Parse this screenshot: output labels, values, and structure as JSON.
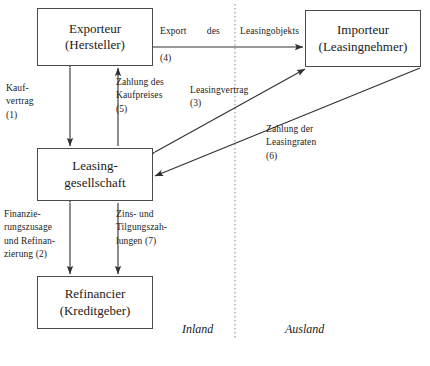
{
  "diagram": {
    "title_nodes": {
      "exporteur": {
        "line1": "Exporteur",
        "line2": "(Hersteller)"
      },
      "importeur": {
        "line1": "Importeur",
        "line2": "(Leasingnehmer)"
      },
      "leasinggesell": {
        "line1": "Leasing-",
        "line2": "gesellschaft"
      },
      "refinancier": {
        "line1": "Refinancier",
        "line2": "(Kreditgeber)"
      }
    },
    "edge_labels": {
      "export_word1": "Export",
      "export_word2": "des",
      "export_word3": "Leasingobjekts",
      "export_num": "(4)",
      "kaufvertrag": "Kauf-\nvertrag\n(1)",
      "zahlung_kaufpreises": "Zahlung des\nKaufpreises\n(5)",
      "leasingvertrag": "Leasingvertrag\n(3)",
      "zahlung_leasingraten": "Zahlung der\nLeasingraten\n(6)",
      "finanzierungszusage": "Finanzie-\nrungszusage\nund Refinan-\nzierung (2)",
      "zins_tilgung": "Zins- und\nTilgungszah-\nlungen (7)"
    },
    "regions": {
      "inland": "Inland",
      "ausland": "Ausland"
    },
    "colors": {
      "box_border": "#4a4a4a",
      "wire": "#303030",
      "divider": "#9a9a9a",
      "background": "#ffffff",
      "text": "#1a1a1a"
    }
  }
}
